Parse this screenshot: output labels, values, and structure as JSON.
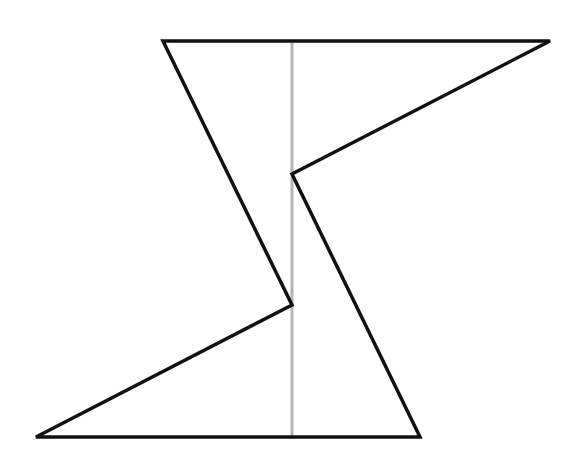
{
  "diagram": {
    "canvas": {
      "width": 579,
      "height": 463,
      "background": "#ffffff"
    },
    "shape": {
      "stroke": "#111111",
      "stroke_width": 3.5,
      "points": "163,41 550,41 292,174 420,437 36,437 292,305"
    },
    "axis_line": {
      "stroke": "#b5b5b5",
      "stroke_width": 3,
      "x1": 292,
      "y1": 41,
      "x2": 292,
      "y2": 437
    }
  }
}
